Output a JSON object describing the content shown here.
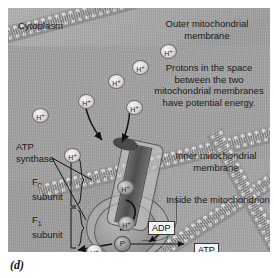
{
  "figure": {
    "letter": "(d)",
    "background_color": "#9e9e9e",
    "ink_color": "#1a1a1a"
  },
  "labels": {
    "cytoplasm": "Cytoplasm",
    "outer_membrane": "Outer mitochondrial membrane",
    "protons_note": "Protons in the space between the two mitochondrial membranes have potential energy.",
    "inner_membrane": "Inner mitochondrial membrane",
    "inside": "Inside the mitochondrion",
    "atp_synthase": "ATP synthase",
    "f0_subunit_name": "F",
    "f0_subunit_sub": "0",
    "f0_subunit_word": "subunit",
    "f1_subunit_name": "F",
    "f1_subunit_sub": "1",
    "f1_subunit_word": "subunit"
  },
  "molecules": {
    "proton_symbol": "H",
    "proton_charge": "+",
    "phosphate_symbol": "P",
    "adp": "ADP",
    "atp": "ATP"
  },
  "protons": [
    {
      "id": "proton-1",
      "x": 24,
      "y": 100
    },
    {
      "id": "proton-2",
      "x": 70,
      "y": 86
    },
    {
      "id": "proton-3",
      "x": 100,
      "y": 66
    },
    {
      "id": "proton-4",
      "x": 124,
      "y": 52
    },
    {
      "id": "proton-5",
      "x": 152,
      "y": 36
    },
    {
      "id": "proton-6",
      "x": 118,
      "y": 92
    },
    {
      "id": "proton-7",
      "x": 56,
      "y": 140
    },
    {
      "id": "proton-8",
      "x": 109,
      "y": 172
    },
    {
      "id": "proton-9",
      "x": 110,
      "y": 208
    },
    {
      "id": "proton-10",
      "x": 78,
      "y": 236
    }
  ]
}
